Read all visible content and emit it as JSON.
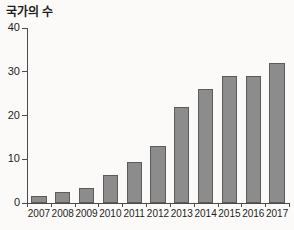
{
  "chart_data": {
    "type": "bar",
    "title": "국가의 수",
    "xlabel": "",
    "ylabel": "",
    "categories": [
      "2007",
      "2008",
      "2009",
      "2010",
      "2011",
      "2012",
      "2013",
      "2014",
      "2015",
      "2016",
      "2017"
    ],
    "values": [
      1.7,
      2.5,
      3.5,
      6.5,
      9.4,
      13,
      22,
      26,
      29,
      29,
      32
    ],
    "ylim": [
      0,
      40
    ],
    "yticks": [
      0,
      10,
      20,
      30,
      40
    ],
    "ytick_labels": [
      "0",
      "10",
      "20",
      "30",
      "40"
    ],
    "grid": false,
    "legend": null,
    "bar_color": "#8c8c8c",
    "bar_edge_color": "#5b5b5b",
    "axis_color": "#4a4a4a",
    "background_color": "#fbfaf8",
    "text_color": "#1d1d1d"
  }
}
